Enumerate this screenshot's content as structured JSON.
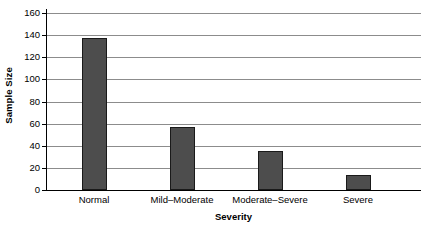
{
  "chart_data": {
    "type": "bar",
    "title": "",
    "xlabel": "Severity",
    "ylabel": "Sample Size",
    "categories": [
      "Normal",
      "Mild–Moderate",
      "Moderate–Severe",
      "Severe"
    ],
    "values": [
      137,
      57,
      35,
      14
    ],
    "ylim": [
      0,
      160
    ],
    "y_ticks": [
      0,
      20,
      40,
      60,
      80,
      100,
      120,
      140,
      160
    ],
    "y_tick_labels": [
      "0",
      "20",
      "40",
      "60",
      "80",
      "100",
      "120",
      "140",
      "160"
    ],
    "grid": true,
    "grid_axis": "y",
    "legend": false,
    "legend_position": "none",
    "bar_color": "#4d4d4d",
    "bar_edge_color": "#1a1a1a",
    "grid_color": "#8c8c8c",
    "axis_color": "#000000",
    "background_color": "#ffffff"
  }
}
